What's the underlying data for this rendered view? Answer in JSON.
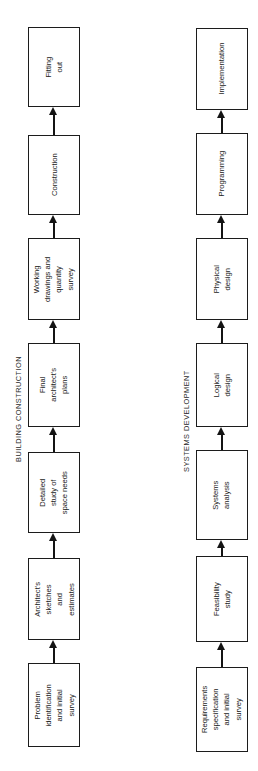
{
  "figure": {
    "type": "flow-comparison-diagram",
    "orientation": "rotated-90-ccw",
    "lanes": [
      {
        "id": "building-construction",
        "title": "BUILDING CONSTRUCTION",
        "steps": [
          {
            "label": "Problem\nidentification\nand initial\nsurvey"
          },
          {
            "label": "Architect's\nsketches\nand\nestimates"
          },
          {
            "label": "Detailed\nstudy of\nspace needs"
          },
          {
            "label": "Final\narchitect's\nplans"
          },
          {
            "label": "Working\ndrawings and\nquantity\nsurvey"
          },
          {
            "label": "Construction"
          },
          {
            "label": "Fitting\nout"
          }
        ]
      },
      {
        "id": "systems-development",
        "title": "SYSTEMS DEVELOPMENT",
        "steps": [
          {
            "label": "Requirements\nspecification\nand initial\nsurvey"
          },
          {
            "label": "Feasibility\nstudy"
          },
          {
            "label": "Systems\nanalysis"
          },
          {
            "label": "Logical\ndesign"
          },
          {
            "label": "Physical\ndesign"
          },
          {
            "label": "Programming"
          },
          {
            "label": "Implementation"
          }
        ]
      }
    ],
    "colors": {
      "background": "#ffffff",
      "stroke": "#1c1c1c",
      "text": "#1a1a1a"
    }
  }
}
